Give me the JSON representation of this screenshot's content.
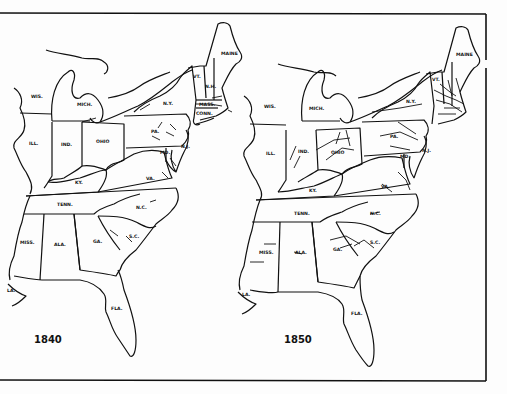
{
  "figure": {
    "colors": {
      "ink": "#111111",
      "paper": "#fdfdfd"
    }
  },
  "maps": [
    {
      "year": "1840",
      "labels": {
        "maine": "MAINE",
        "vt": "VT.",
        "nh": "N.H.",
        "ny": "N.Y.",
        "mass": "MASS.",
        "conn": "CONN.",
        "pa": "PA.",
        "nj": "N.J.",
        "md": "MD.",
        "ohio": "OHIO",
        "mich": "MICH.",
        "wis": "WIS.",
        "ill": "ILL.",
        "ind": "IND.",
        "ky": "KY.",
        "va": "VA.",
        "tenn": "TENN.",
        "nc": "N.C.",
        "sc": "S.C.",
        "ga": "GA.",
        "ala": "ALA.",
        "miss": "MISS.",
        "la": "LA.",
        "fla": "FLA."
      }
    },
    {
      "year": "1850",
      "labels": {
        "maine": "MAINE",
        "vt": "VT.",
        "ny": "N.Y.",
        "pa": "PA.",
        "nj": "N.J.",
        "md": "MD.",
        "ohio": "OHIO",
        "mich": "MICH.",
        "wis": "WIS.",
        "ill": "ILL.",
        "ind": "IND.",
        "ky": "KY.",
        "va": "VA.",
        "tenn": "TENN.",
        "nc": "N.C.",
        "sc": "S.C.",
        "ga": "GA.",
        "ala": "ALA.",
        "miss": "MISS.",
        "la": "LA.",
        "fla": "FLA."
      }
    }
  ]
}
